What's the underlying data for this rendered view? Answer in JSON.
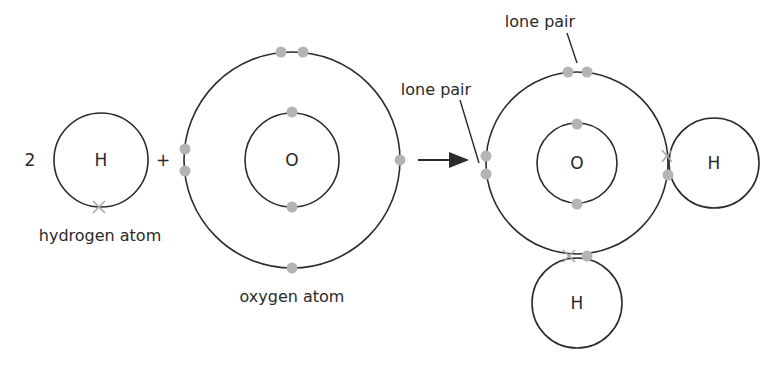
{
  "diagram": {
    "colors": {
      "shell": "#2b2b2b",
      "electron_dot": "#b4b4b4",
      "electron_cross": "#a8a8a8",
      "text": "#2a2a2a"
    },
    "reactants": {
      "coefficient": "2",
      "hydrogen": {
        "symbol": "H",
        "label": "hydrogen atom",
        "electrons": 1
      },
      "plus": "+",
      "oxygen": {
        "symbol": "O",
        "label": "oxygen atom",
        "inner_electrons": 2,
        "outer_electrons": 6
      }
    },
    "arrow": "→",
    "product": {
      "oxygen_symbol": "O",
      "hydrogen_right_symbol": "H",
      "hydrogen_bottom_symbol": "H",
      "annotations": [
        "lone pair",
        "lone pair"
      ]
    }
  }
}
